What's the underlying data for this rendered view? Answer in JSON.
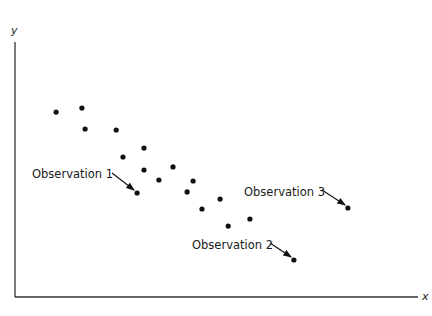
{
  "chart_data": {
    "type": "scatter",
    "title": "",
    "xlabel": "x",
    "ylabel": "y",
    "xlim": [
      0,
      100
    ],
    "ylim": [
      0,
      100
    ],
    "grid": false,
    "legend": null,
    "ticks": {
      "x": [],
      "y": []
    },
    "series": [
      {
        "name": "observations",
        "points": [
          {
            "x": 10.2,
            "y": 72.5
          },
          {
            "x": 16.6,
            "y": 74.1
          },
          {
            "x": 17.4,
            "y": 65.9
          },
          {
            "x": 25.1,
            "y": 65.5
          },
          {
            "x": 32.0,
            "y": 58.4
          },
          {
            "x": 26.8,
            "y": 54.9
          },
          {
            "x": 32.0,
            "y": 49.8
          },
          {
            "x": 39.2,
            "y": 51.0
          },
          {
            "x": 30.3,
            "y": 40.8,
            "label": "Observation 1"
          },
          {
            "x": 35.7,
            "y": 45.9
          },
          {
            "x": 44.2,
            "y": 45.5
          },
          {
            "x": 42.7,
            "y": 41.2
          },
          {
            "x": 50.9,
            "y": 38.4
          },
          {
            "x": 46.4,
            "y": 34.5
          },
          {
            "x": 58.3,
            "y": 30.6
          },
          {
            "x": 52.9,
            "y": 27.8
          },
          {
            "x": 69.2,
            "y": 14.5,
            "label": "Observation 2"
          },
          {
            "x": 82.6,
            "y": 34.9,
            "label": "Observation 3"
          }
        ]
      }
    ],
    "annotations": [
      {
        "text": "Observation 1",
        "target_index": 8,
        "arrow": true
      },
      {
        "text": "Observation 2",
        "target_index": 16,
        "arrow": true
      },
      {
        "text": "Observation 3",
        "target_index": 17,
        "arrow": true
      }
    ]
  },
  "labels": {
    "x_axis": "x",
    "y_axis": "y",
    "obs1": "Observation 1",
    "obs2": "Observation 2",
    "obs3": "Observation 3"
  },
  "colors": {
    "axis": "#333333",
    "point": "#111111",
    "text": "#1a1a1a"
  }
}
